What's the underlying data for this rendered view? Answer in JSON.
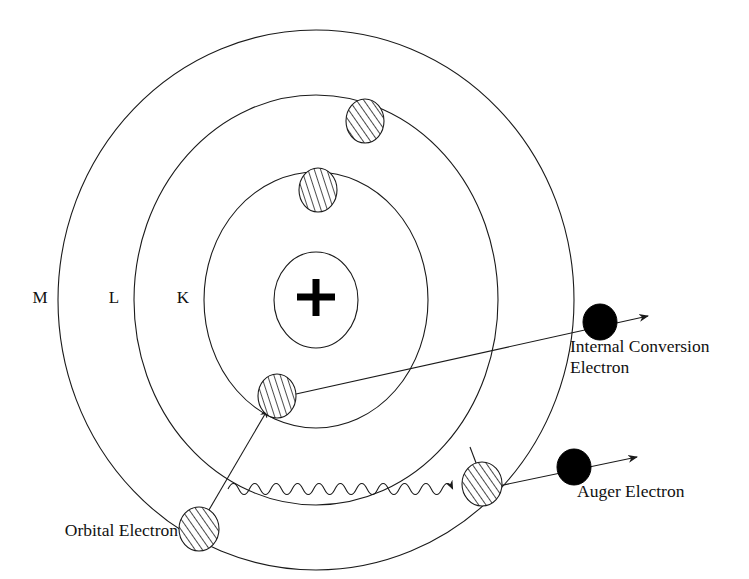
{
  "figure": {
    "background_color": "#ffffff",
    "stroke_color": "#1a1a1a",
    "fill_color": "#000000",
    "width": 749,
    "height": 579
  },
  "nucleus": {
    "symbol": "+",
    "center_x": 316,
    "center_y": 300,
    "radius_x": 42,
    "radius_y": 48
  },
  "shells": [
    {
      "label": "K",
      "name": "k-shell",
      "center_x": 316,
      "center_y": 300,
      "radius_x": 112,
      "radius_y": 128,
      "label_x": 183,
      "label_y": 303
    },
    {
      "label": "L",
      "name": "l-shell",
      "center_x": 316,
      "center_y": 300,
      "radius_x": 182,
      "radius_y": 205,
      "label_x": 114,
      "label_y": 303
    },
    {
      "label": "M",
      "name": "m-shell",
      "center_x": 316,
      "center_y": 300,
      "radius_x": 258,
      "radius_y": 270,
      "label_x": 40,
      "label_y": 303
    }
  ],
  "electrons": [
    {
      "name": "l-shell-electron-upper-right",
      "style": "hatched",
      "shell": "L",
      "cx": 365,
      "cy": 121,
      "rx": 19,
      "ry": 22
    },
    {
      "name": "k-shell-electron-top",
      "style": "hatched-faint",
      "shell": "K",
      "cx": 318,
      "cy": 190,
      "rx": 19,
      "ry": 22
    },
    {
      "name": "k-shell-vacancy-electron",
      "style": "hatched-faint",
      "shell": "K",
      "cx": 277,
      "cy": 396,
      "rx": 19,
      "ry": 22
    },
    {
      "name": "orbital-electron-source",
      "style": "hatched",
      "shell": "M",
      "cx": 199,
      "cy": 529,
      "rx": 20,
      "ry": 22
    },
    {
      "name": "m-shell-auger-source-electron",
      "style": "hatched",
      "shell": "M",
      "cx": 482,
      "cy": 484,
      "rx": 20,
      "ry": 22
    },
    {
      "name": "internal-conversion-electron-dot",
      "style": "solid",
      "shell": "free",
      "cx": 600,
      "cy": 322,
      "rx": 17,
      "ry": 18
    },
    {
      "name": "auger-electron-dot",
      "style": "solid",
      "shell": "free",
      "cx": 574,
      "cy": 467,
      "rx": 17,
      "ry": 18
    }
  ],
  "annotations": [
    {
      "name": "internal-conversion-electron-label",
      "lines": [
        "Internal Conversion",
        "Electron"
      ],
      "x": 570,
      "y": 352,
      "anchor": "start"
    },
    {
      "name": "auger-electron-label",
      "lines": [
        "Auger Electron"
      ],
      "x": 577,
      "y": 497,
      "anchor": "start"
    },
    {
      "name": "orbital-electron-label",
      "lines": [
        "Orbital Electron"
      ],
      "x": 178,
      "y": 536,
      "anchor": "end"
    }
  ],
  "paths": {
    "internal_conversion_track": {
      "name": "internal-conversion-track",
      "from_x": 287,
      "from_y": 396,
      "to_x": 648,
      "to_y": 316,
      "arrow": true
    },
    "auger_track": {
      "name": "auger-electron-track",
      "from_x": 496,
      "from_y": 481,
      "to_x": 637,
      "to_y": 457,
      "arrow": true
    },
    "orbital_transition_arrow": {
      "name": "orbital-electron-transition-arrow",
      "from_x": 212,
      "from_y": 514,
      "to_x": 266,
      "to_y": 410,
      "arrow": true
    },
    "photon_wave": {
      "name": "characteristic-xray-photon",
      "from_x": 228,
      "from_y": 489,
      "to_x": 464,
      "to_y": 484,
      "cycles": 11,
      "amplitude": 9,
      "arrow": true
    }
  }
}
